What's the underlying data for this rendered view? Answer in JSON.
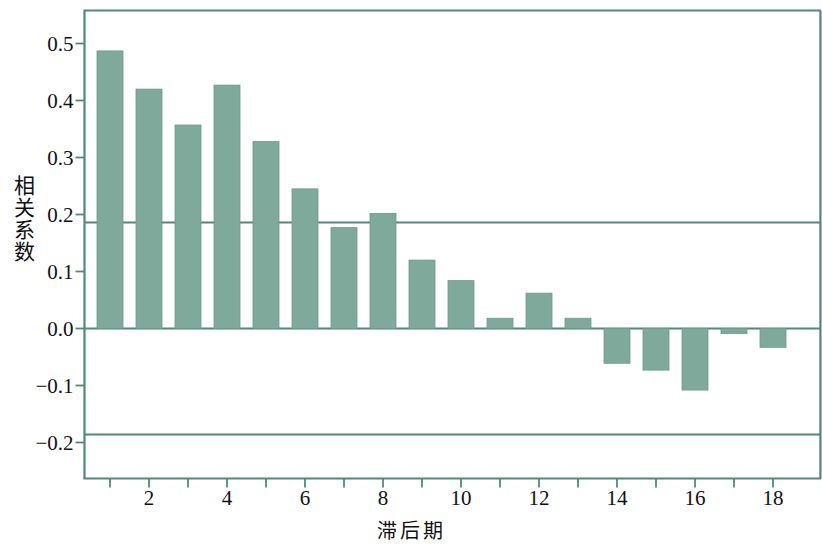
{
  "chart_data": {
    "type": "bar",
    "title": "",
    "xlabel": "滞后期",
    "ylabel": "相关系数",
    "categories": [
      1,
      2,
      3,
      4,
      5,
      6,
      7,
      8,
      9,
      10,
      11,
      12,
      13,
      14,
      15,
      16,
      17,
      18
    ],
    "values": [
      0.487,
      0.42,
      0.357,
      0.427,
      0.328,
      0.245,
      0.177,
      0.202,
      0.12,
      0.084,
      0.018,
      0.062,
      0.018,
      -0.061,
      -0.073,
      -0.108,
      -0.009,
      -0.033
    ],
    "series": [
      {
        "name": "相关系数",
        "values": [
          0.487,
          0.42,
          0.357,
          0.427,
          0.328,
          0.245,
          0.177,
          0.202,
          0.12,
          0.084,
          0.018,
          0.062,
          0.018,
          -0.061,
          -0.073,
          -0.108,
          -0.009,
          -0.033
        ]
      }
    ],
    "ylim": [
      -0.26,
      0.555
    ],
    "xlim": [
      0.3,
      18.9
    ],
    "yticks": [
      0.5,
      0.4,
      0.3,
      0.2,
      0.1,
      0.0,
      -0.1,
      -0.2
    ],
    "ytick_labels": [
      "0.5",
      "0.4",
      "0.3",
      "0.2",
      "0.1",
      "0.0",
      "-0.1",
      "-0.2"
    ],
    "xticks": [
      1,
      2,
      3,
      4,
      5,
      6,
      7,
      8,
      9,
      10,
      11,
      12,
      13,
      14,
      15,
      16,
      17,
      18
    ],
    "xtick_labels": [
      "",
      "2",
      "",
      "4",
      "",
      "6",
      "",
      "8",
      "",
      "10",
      "",
      "12",
      "",
      "14",
      "",
      "16",
      "",
      "18"
    ],
    "grid": false,
    "legend": "none",
    "reference_lines": [
      {
        "name": "upper-confidence-bound",
        "value": 0.186
      },
      {
        "name": "zero-baseline",
        "value": 0.0
      },
      {
        "name": "lower-confidence-bound",
        "value": -0.186
      }
    ],
    "colors": {
      "bar_fill": "#7fa99b",
      "bar_edge": "#6d9a8c",
      "axis": "#4e8a7b",
      "reference_line": "#4e8a7b",
      "text": "#111111",
      "background": "#ffffff"
    }
  }
}
